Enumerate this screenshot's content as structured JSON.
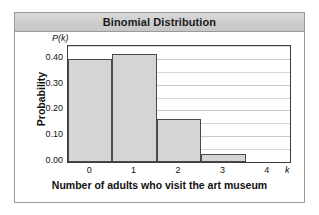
{
  "figure": {
    "title": "Binomial Distribution"
  },
  "chart_data": {
    "type": "bar",
    "title": "Binomial Distribution",
    "xlabel": "Number of adults who visit the art museum",
    "ylabel": "Probability",
    "x_variable_symbol": "k",
    "y_variable_symbol": "P(k)",
    "categories": [
      "0",
      "1",
      "2",
      "3",
      "4"
    ],
    "values": [
      0.4,
      0.42,
      0.165,
      0.03,
      0.0
    ],
    "xlim": [
      -0.5,
      4.5
    ],
    "ylim": [
      0.0,
      0.45
    ],
    "y_tick_labels": [
      "0.00",
      "0.10",
      "0.20",
      "0.30",
      "0.40"
    ],
    "y_tick_values": [
      0.0,
      0.1,
      0.2,
      0.3,
      0.4
    ],
    "x_tick_labels": [
      "0",
      "1",
      "2",
      "3",
      "4"
    ],
    "grid": true,
    "grid_interval": 0.05,
    "legend": null,
    "bar_fill_color": "#d5d5d5",
    "bar_edge_color": "#4a4a4a",
    "title_bar_color": "#cdcdcd",
    "frame_color": "#9a9a9a"
  }
}
